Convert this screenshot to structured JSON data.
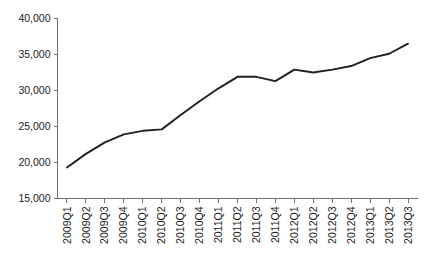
{
  "chart_data": {
    "type": "line",
    "title": "",
    "subtitle": "",
    "xlabel": "",
    "ylabel": "",
    "grid": false,
    "legend": false,
    "legend_position": "none",
    "line_color": "#211f1f",
    "axis_color": "#6f6f6f",
    "background_color": "#ffffff",
    "ylim": [
      15000,
      40000
    ],
    "ytick_step": 5000,
    "ytick_labels": [
      "40,000",
      "35,000",
      "30,000",
      "25,000",
      "20,000",
      "15,000"
    ],
    "ytick_values": [
      40000,
      35000,
      30000,
      25000,
      20000,
      15000
    ],
    "categories": [
      "2009Q1",
      "2009Q2",
      "2009Q3",
      "2009Q4",
      "2010Q1",
      "2010Q2",
      "2010Q3",
      "2010Q4",
      "2011Q1",
      "2011Q2",
      "2011Q3",
      "2011Q4",
      "2012Q1",
      "2012Q2",
      "2012Q3",
      "2012Q4",
      "2013Q1",
      "2013Q2",
      "2013Q3"
    ],
    "values": [
      19300,
      21200,
      22800,
      23900,
      24400,
      24600,
      26600,
      28500,
      30300,
      31900,
      31900,
      31300,
      32900,
      32500,
      32900,
      33400,
      34500,
      35100,
      36500
    ],
    "series": [
      {
        "name": "series-1",
        "values": [
          19300,
          21200,
          22800,
          23900,
          24400,
          24600,
          26600,
          28500,
          30300,
          31900,
          31900,
          31300,
          32900,
          32500,
          32900,
          33400,
          34500,
          35100,
          36500
        ]
      }
    ]
  }
}
